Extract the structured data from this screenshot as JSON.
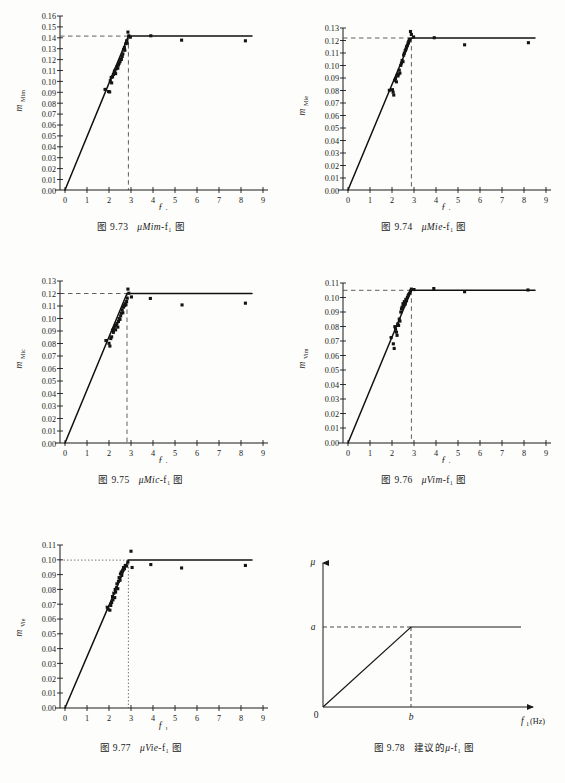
{
  "figure": {
    "page_background": "#fdfdfb",
    "ink_color": "#141414"
  },
  "panels": [
    {
      "id": "fig-9-73",
      "caption_number": "图 9.73",
      "caption_symbol": "μMim",
      "caption_tail": "-f₁ 图",
      "y_axis_label_base": "m",
      "y_axis_label_sub": "Mim",
      "x_axis_label_base": "f",
      "x_axis_label_sub": "1",
      "chart_data": {
        "type": "scatter",
        "title": "图 9.73 μMim-f₁ 图",
        "xlabel": "f₁",
        "ylabel": "m_Mim",
        "xlim": [
          0,
          9
        ],
        "ylim": [
          0,
          0.16
        ],
        "xticks": [
          "0",
          "1",
          "2",
          "3",
          "4",
          "5",
          "6",
          "7",
          "8",
          "9"
        ],
        "yticks": [
          "0.00",
          "0.01",
          "0.02",
          "0.03",
          "0.04",
          "0.05",
          "0.06",
          "0.07",
          "0.08",
          "0.09",
          "0.10",
          "0.11",
          "0.12",
          "0.13",
          "0.14",
          "0.15",
          "0.16"
        ],
        "grid": false,
        "legend": "none",
        "knee_x": 2.88,
        "plateau_y": 0.1425,
        "fit_line_end_x": 8.5,
        "annotations": [
          "vertical dashed line at f₁ = 2.9",
          "horizontal dashed line at m = 0.1425"
        ],
        "points": [
          [
            1.82,
            0.0925
          ],
          [
            1.98,
            0.0905
          ],
          [
            2.03,
            0.0902
          ],
          [
            2.06,
            0.1005
          ],
          [
            2.1,
            0.1035
          ],
          [
            2.12,
            0.0985
          ],
          [
            2.16,
            0.104
          ],
          [
            2.2,
            0.1062
          ],
          [
            2.24,
            0.1085
          ],
          [
            2.27,
            0.11
          ],
          [
            2.3,
            0.107
          ],
          [
            2.33,
            0.1115
          ],
          [
            2.36,
            0.1132
          ],
          [
            2.4,
            0.112
          ],
          [
            2.43,
            0.115
          ],
          [
            2.46,
            0.1165
          ],
          [
            2.5,
            0.118
          ],
          [
            2.53,
            0.1205
          ],
          [
            2.56,
            0.12
          ],
          [
            2.6,
            0.1228
          ],
          [
            2.63,
            0.1252
          ],
          [
            2.66,
            0.129
          ],
          [
            2.7,
            0.131
          ],
          [
            2.72,
            0.1285
          ],
          [
            2.76,
            0.1345
          ],
          [
            2.8,
            0.1372
          ],
          [
            2.83,
            0.135
          ],
          [
            2.86,
            0.1452
          ],
          [
            2.9,
            0.1418
          ],
          [
            2.97,
            0.1405
          ],
          [
            3.9,
            0.1418
          ],
          [
            5.3,
            0.1378
          ],
          [
            8.2,
            0.1372
          ]
        ]
      }
    },
    {
      "id": "fig-9-74",
      "caption_number": "图 9.74",
      "caption_symbol": "μMie",
      "caption_tail": "-f₁ 图",
      "y_axis_label_base": "m",
      "y_axis_label_sub": "Mie",
      "x_axis_label_base": "f",
      "x_axis_label_sub": "1",
      "chart_data": {
        "type": "scatter",
        "title": "图 9.74 μMie-f₁ 图",
        "xlabel": "f₁",
        "ylabel": "m_Mie",
        "xlim": [
          0,
          9
        ],
        "ylim": [
          0,
          0.13
        ],
        "xticks": [
          "0",
          "1",
          "2",
          "3",
          "4",
          "5",
          "6",
          "7",
          "8",
          "9"
        ],
        "yticks": [
          "0.00",
          "0.01",
          "0.02",
          "0.03",
          "0.04",
          "0.05",
          "0.06",
          "0.07",
          "0.08",
          "0.09",
          "0.10",
          "0.11",
          "0.12",
          "0.13"
        ],
        "grid": false,
        "legend": "none",
        "knee_x": 2.88,
        "plateau_y": 0.124,
        "fit_line_end_x": 8.5,
        "annotations": [
          "vertical dashed line at f₁ = 2.9",
          "horizontal dashed line at m = 0.124"
        ],
        "points": [
          [
            1.88,
            0.08
          ],
          [
            2.02,
            0.0805
          ],
          [
            2.05,
            0.0785
          ],
          [
            2.08,
            0.0762
          ],
          [
            2.12,
            0.088
          ],
          [
            2.16,
            0.0895
          ],
          [
            2.2,
            0.0868
          ],
          [
            2.24,
            0.092
          ],
          [
            2.27,
            0.0915
          ],
          [
            2.3,
            0.093
          ],
          [
            2.33,
            0.0962
          ],
          [
            2.36,
            0.0938
          ],
          [
            2.4,
            0.1
          ],
          [
            2.43,
            0.1018
          ],
          [
            2.46,
            0.104
          ],
          [
            2.5,
            0.103
          ],
          [
            2.53,
            0.1082
          ],
          [
            2.56,
            0.1098
          ],
          [
            2.6,
            0.1118
          ],
          [
            2.63,
            0.113
          ],
          [
            2.66,
            0.115
          ],
          [
            2.7,
            0.1162
          ],
          [
            2.73,
            0.118
          ],
          [
            2.76,
            0.1195
          ],
          [
            2.8,
            0.121
          ],
          [
            2.84,
            0.1272
          ],
          [
            2.88,
            0.1248
          ],
          [
            2.98,
            0.1228
          ],
          [
            3.92,
            0.1222
          ],
          [
            5.3,
            0.1165
          ],
          [
            8.2,
            0.1182
          ]
        ]
      }
    },
    {
      "id": "fig-9-75",
      "caption_number": "图 9.75",
      "caption_symbol": "μMic",
      "caption_tail": "-f₁ 图",
      "y_axis_label_base": "m",
      "y_axis_label_sub": "Mic",
      "x_axis_label_base": "f",
      "x_axis_label_sub": "1",
      "chart_data": {
        "type": "scatter",
        "title": "图 9.75 μMic-f₁ 图",
        "xlabel": "f₁",
        "ylabel": "m_Mic",
        "xlim": [
          0,
          9
        ],
        "ylim": [
          0,
          0.13
        ],
        "xticks": [
          "0",
          "1",
          "2",
          "3",
          "4",
          "5",
          "6",
          "7",
          "8",
          "9"
        ],
        "yticks": [
          "0.00",
          "0.01",
          "0.02",
          "0.03",
          "0.04",
          "0.05",
          "0.06",
          "0.07",
          "0.08",
          "0.09",
          "0.10",
          "0.11",
          "0.12",
          "0.13"
        ],
        "grid": false,
        "legend": "none",
        "knee_x": 2.86,
        "plateau_y": 0.12,
        "fit_line_end_x": 8.5,
        "annotations": [
          "vertical dashed line at f₁ = 2.9",
          "horizontal dashed line at m = 0.120"
        ],
        "points": [
          [
            1.86,
            0.0822
          ],
          [
            2.0,
            0.08
          ],
          [
            2.04,
            0.0778
          ],
          [
            2.08,
            0.0838
          ],
          [
            2.12,
            0.0852
          ],
          [
            2.16,
            0.0905
          ],
          [
            2.2,
            0.0888
          ],
          [
            2.23,
            0.092
          ],
          [
            2.26,
            0.0938
          ],
          [
            2.3,
            0.0908
          ],
          [
            2.33,
            0.0945
          ],
          [
            2.36,
            0.096
          ],
          [
            2.4,
            0.093
          ],
          [
            2.43,
            0.0975
          ],
          [
            2.46,
            0.0998
          ],
          [
            2.5,
            0.0992
          ],
          [
            2.53,
            0.102
          ],
          [
            2.56,
            0.1042
          ],
          [
            2.6,
            0.1068
          ],
          [
            2.63,
            0.1045
          ],
          [
            2.66,
            0.109
          ],
          [
            2.7,
            0.1102
          ],
          [
            2.73,
            0.1118
          ],
          [
            2.76,
            0.1108
          ],
          [
            2.8,
            0.1135
          ],
          [
            2.83,
            0.1162
          ],
          [
            2.86,
            0.1235
          ],
          [
            2.9,
            0.1202
          ],
          [
            3.02,
            0.1172
          ],
          [
            3.88,
            0.116
          ],
          [
            5.32,
            0.1108
          ],
          [
            8.2,
            0.1122
          ]
        ]
      }
    },
    {
      "id": "fig-9-76",
      "caption_number": "图 9.76",
      "caption_symbol": "μVim",
      "caption_tail": "-f₁ 图",
      "y_axis_label_base": "m",
      "y_axis_label_sub": "Vim",
      "x_axis_label_base": "f",
      "x_axis_label_sub": "1",
      "chart_data": {
        "type": "scatter",
        "title": "图 9.76 μVim-f₁ 图",
        "xlabel": "f₁",
        "ylabel": "m_Vim",
        "xlim": [
          0,
          9
        ],
        "ylim": [
          0,
          0.11
        ],
        "xticks": [
          "0",
          "1",
          "2",
          "3",
          "4",
          "5",
          "6",
          "7",
          "8",
          "9"
        ],
        "yticks": [
          "0.00",
          "0.01",
          "0.02",
          "0.03",
          "0.04",
          "0.05",
          "0.06",
          "0.07",
          "0.08",
          "0.09",
          "0.10",
          "0.11"
        ],
        "grid": false,
        "legend": "none",
        "knee_x": 2.88,
        "plateau_y": 0.1055,
        "fit_line_end_x": 8.5,
        "annotations": [
          "vertical dashed line at f₁ = 2.9",
          "horizontal dashed line at m = 0.1055"
        ],
        "points": [
          [
            1.96,
            0.0725
          ],
          [
            2.06,
            0.0682
          ],
          [
            2.1,
            0.065
          ],
          [
            2.13,
            0.08
          ],
          [
            2.16,
            0.0782
          ],
          [
            2.2,
            0.0762
          ],
          [
            2.23,
            0.074
          ],
          [
            2.26,
            0.0818
          ],
          [
            2.3,
            0.0808
          ],
          [
            2.33,
            0.0852
          ],
          [
            2.36,
            0.0838
          ],
          [
            2.4,
            0.09
          ],
          [
            2.43,
            0.0922
          ],
          [
            2.46,
            0.0935
          ],
          [
            2.5,
            0.0958
          ],
          [
            2.53,
            0.0942
          ],
          [
            2.56,
            0.0972
          ],
          [
            2.6,
            0.0955
          ],
          [
            2.63,
            0.0988
          ],
          [
            2.66,
            0.0978
          ],
          [
            2.7,
            0.1
          ],
          [
            2.73,
            0.1012
          ],
          [
            2.76,
            0.1022
          ],
          [
            2.8,
            0.103
          ],
          [
            2.84,
            0.1045
          ],
          [
            2.88,
            0.1058
          ],
          [
            3.0,
            0.1055
          ],
          [
            3.9,
            0.1062
          ],
          [
            5.3,
            0.104
          ],
          [
            8.18,
            0.1052
          ]
        ]
      }
    },
    {
      "id": "fig-9-77",
      "caption_number": "图 9.77",
      "caption_symbol": "μVie",
      "caption_tail": "-f₁ 图",
      "y_axis_label_base": "m",
      "y_axis_label_sub": "Vie",
      "x_axis_label_base": "f",
      "x_axis_label_sub": "1",
      "chart_data": {
        "type": "scatter",
        "title": "图 9.77 μVie-f₁ 图",
        "xlabel": "f₁",
        "ylabel": "m_Vie",
        "xlim": [
          0,
          9
        ],
        "ylim": [
          0,
          0.11
        ],
        "xticks": [
          "0",
          "1",
          "2",
          "3",
          "4",
          "5",
          "6",
          "7",
          "8",
          "9"
        ],
        "yticks": [
          "0.00",
          "0.01",
          "0.02",
          "0.03",
          "0.04",
          "0.05",
          "0.06",
          "0.07",
          "0.08",
          "0.09",
          "0.10",
          "0.11"
        ],
        "grid": false,
        "legend": "none",
        "knee_x": 2.88,
        "plateau_y": 0.0998,
        "fit_line_end_x": 8.5,
        "annotations": [
          "vertical dotted line at f₁ = 2.9",
          "horizontal dotted line at m = 0.100"
        ],
        "points": [
          [
            1.92,
            0.068
          ],
          [
            1.96,
            0.0668
          ],
          [
            2.04,
            0.066
          ],
          [
            2.08,
            0.0692
          ],
          [
            2.12,
            0.0712
          ],
          [
            2.16,
            0.0752
          ],
          [
            2.18,
            0.073
          ],
          [
            2.22,
            0.0775
          ],
          [
            2.26,
            0.0745
          ],
          [
            2.28,
            0.08
          ],
          [
            2.3,
            0.0782
          ],
          [
            2.34,
            0.0812
          ],
          [
            2.36,
            0.0838
          ],
          [
            2.4,
            0.0805
          ],
          [
            2.43,
            0.0855
          ],
          [
            2.46,
            0.088
          ],
          [
            2.5,
            0.0862
          ],
          [
            2.52,
            0.0905
          ],
          [
            2.56,
            0.0918
          ],
          [
            2.58,
            0.0895
          ],
          [
            2.62,
            0.093
          ],
          [
            2.66,
            0.0948
          ],
          [
            2.7,
            0.094
          ],
          [
            2.74,
            0.0962
          ],
          [
            2.8,
            0.0958
          ],
          [
            2.86,
            0.0985
          ],
          [
            3.0,
            0.1058
          ],
          [
            3.05,
            0.0948
          ],
          [
            3.9,
            0.0968
          ],
          [
            5.3,
            0.0945
          ],
          [
            8.2,
            0.0962
          ]
        ]
      }
    },
    {
      "id": "fig-9-78",
      "caption_number": "图 9.78",
      "caption_prefix": "建议的",
      "caption_symbol": "μ",
      "caption_tail": "-f₁ 图",
      "y_axis_label": "μ",
      "x_axis_label_base": "f",
      "x_axis_label_sub": "1",
      "x_axis_unit": "(Hz)",
      "origin_label": "0",
      "chart_data": {
        "type": "line",
        "title": "图 9.78 建议的 μ-f₁ 图",
        "xlabel": "f₁(Hz)",
        "ylabel": "μ",
        "grid": false,
        "legend": "none",
        "plateau_label": "a",
        "knee_label": "b",
        "origin_label": "0",
        "annotations": [
          "dashed horizontal from a to knee",
          "dashed vertical from b up to knee"
        ],
        "x": [
          0,
          1,
          3
        ],
        "y": [
          0,
          1,
          1
        ],
        "description": "Bilinear schematic: rises linearly from origin to point (b, a), then constant at a."
      }
    }
  ]
}
